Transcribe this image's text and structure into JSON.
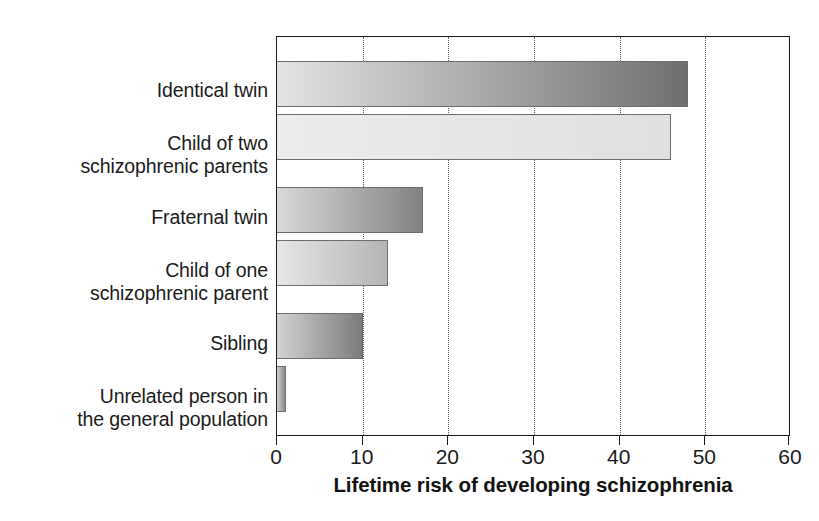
{
  "chart_data": {
    "type": "bar",
    "orientation": "horizontal",
    "title": "",
    "xlabel": "Lifetime risk of developing schizophrenia",
    "ylabel": "",
    "xlim": [
      0,
      60
    ],
    "xticks": [
      0,
      10,
      20,
      30,
      40,
      50,
      60
    ],
    "xtick_labels": [
      "0",
      "10",
      "20",
      "30",
      "40",
      "50",
      "60"
    ],
    "grid": "vertical-dotted",
    "legend": "none",
    "categories": [
      "Identical twin",
      "Child of two\nschizophrenic parents",
      "Fraternal twin",
      "Child of one\nschizophrenic parent",
      "Sibling",
      "Unrelated person in\nthe general population"
    ],
    "values": [
      48,
      46,
      17,
      13,
      10,
      1
    ],
    "bar_colors": [
      {
        "start": "#e3e3e3",
        "end": "#6f6f6f"
      },
      {
        "start": "#ececec",
        "end": "#e0e0e0"
      },
      {
        "start": "#d9d9d9",
        "end": "#828282"
      },
      {
        "start": "#e6e6e6",
        "end": "#b4b4b4"
      },
      {
        "start": "#d2d2d2",
        "end": "#7b7b7b"
      },
      {
        "start": "#cfcfcf",
        "end": "#8a8a8a"
      }
    ]
  },
  "axis": {
    "title": "Lifetime risk of developing schizophrenia",
    "ticks": [
      {
        "value": "0"
      },
      {
        "value": "10"
      },
      {
        "value": "20"
      },
      {
        "value": "30"
      },
      {
        "value": "40"
      },
      {
        "value": "50"
      },
      {
        "value": "60"
      }
    ]
  },
  "categories": [
    {
      "label": "Identical twin"
    },
    {
      "label": "Child of two\nschizophrenic parents"
    },
    {
      "label": "Fraternal twin"
    },
    {
      "label": "Child of one\nschizophrenic parent"
    },
    {
      "label": "Sibling"
    },
    {
      "label": "Unrelated person in\nthe general population"
    }
  ]
}
